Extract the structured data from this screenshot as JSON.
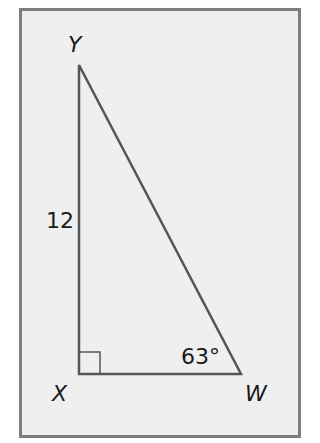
{
  "diagram": {
    "type": "right-triangle",
    "vertices": {
      "Y": {
        "label": "Y"
      },
      "X": {
        "label": "X"
      },
      "W": {
        "label": "W"
      }
    },
    "side_label_XY": "12",
    "angle_label_W": "63°",
    "right_angle_at": "X",
    "colors": {
      "background": "#efefef",
      "frame_border": "#7d7d7d",
      "line": "#555555",
      "text": "#1a1a1a"
    }
  }
}
